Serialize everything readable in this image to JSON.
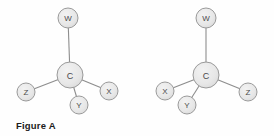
{
  "figure": {
    "caption": "Figure A",
    "background_color": "#fefefe",
    "bond_color": "#8a8a8a",
    "atom_fill_color": "#e8e8e8",
    "atom_stroke_color": "#9a9a9a",
    "label_color": "#4a4a4a"
  },
  "structures": [
    {
      "id": "structure-left",
      "center": {
        "label": "C",
        "cx": 70,
        "cy": 75,
        "r": 13
      },
      "substituents": [
        {
          "label": "W",
          "cx": 68,
          "cy": 18,
          "r": 10
        },
        {
          "label": "Z",
          "cx": 26,
          "cy": 92,
          "r": 9
        },
        {
          "label": "X",
          "cx": 109,
          "cy": 91,
          "r": 9
        },
        {
          "label": "Y",
          "cx": 79,
          "cy": 105,
          "r": 9
        }
      ]
    },
    {
      "id": "structure-right",
      "center": {
        "label": "C",
        "cx": 206,
        "cy": 75,
        "r": 13
      },
      "substituents": [
        {
          "label": "W",
          "cx": 206,
          "cy": 18,
          "r": 10
        },
        {
          "label": "X",
          "cx": 165,
          "cy": 91,
          "r": 9
        },
        {
          "label": "Z",
          "cx": 248,
          "cy": 92,
          "r": 9
        },
        {
          "label": "Y",
          "cx": 187,
          "cy": 105,
          "r": 9
        }
      ]
    }
  ],
  "atom_labels": {
    "left": {
      "center": "C",
      "top": "W",
      "bottom_left": "Z",
      "right": "X",
      "bottom": "Y"
    },
    "right": {
      "center": "C",
      "top": "W",
      "left": "X",
      "bottom_right": "Z",
      "bottom": "Y"
    }
  }
}
